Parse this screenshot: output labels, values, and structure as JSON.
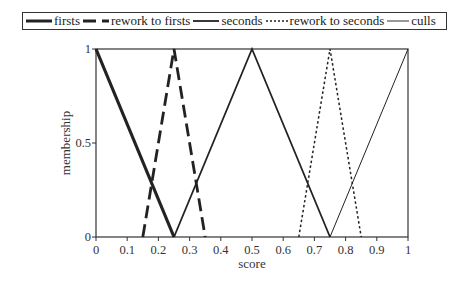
{
  "chart_data": {
    "type": "line",
    "title": "",
    "xlabel": "score",
    "ylabel": "membership",
    "xlim": [
      0,
      1
    ],
    "ylim": [
      0,
      1
    ],
    "xticks": [
      "0",
      "0.1",
      "0.2",
      "0.3",
      "0.4",
      "0.5",
      "0.6",
      "0.7",
      "0.8",
      "0.9",
      "1"
    ],
    "yticks": [
      "0",
      "0.5",
      "1"
    ],
    "grid": false,
    "legend_position": "top",
    "series": [
      {
        "name": "firsts",
        "style": "thick-solid",
        "x": [
          0,
          0.25
        ],
        "y": [
          1,
          0
        ]
      },
      {
        "name": "rework to firsts",
        "style": "thick-dashed",
        "x": [
          0.15,
          0.25,
          0.35
        ],
        "y": [
          0,
          1,
          0
        ]
      },
      {
        "name": "seconds",
        "style": "solid",
        "x": [
          0.25,
          0.5,
          0.75
        ],
        "y": [
          0,
          1,
          0
        ]
      },
      {
        "name": "rework to seconds",
        "style": "dotted",
        "x": [
          0.65,
          0.75,
          0.85
        ],
        "y": [
          0,
          1,
          0
        ]
      },
      {
        "name": "culls",
        "style": "thin-solid",
        "x": [
          0.75,
          1
        ],
        "y": [
          0,
          1
        ]
      }
    ]
  },
  "legend": {
    "items": [
      {
        "label": "firsts"
      },
      {
        "label": "rework to firsts"
      },
      {
        "label": "seconds"
      },
      {
        "label": "rework to seconds"
      },
      {
        "label": "culls"
      }
    ]
  }
}
